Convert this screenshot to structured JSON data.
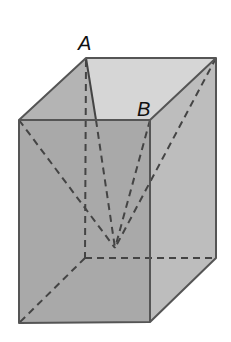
{
  "diagram": {
    "type": "rectangular-prism",
    "labels": {
      "A": "A",
      "B": "B"
    },
    "colors": {
      "background": "#ffffff",
      "front_face": "#a9a9a9",
      "right_face": "#bdbdbd",
      "top_face": "#d6d6d6",
      "left_top_face": "#b2b2b2",
      "edge": "#555555",
      "dashed": "#444444",
      "label": "#111111"
    },
    "vertices": {
      "A_back_top_left": [
        86,
        58
      ],
      "back_top_right": [
        216,
        58
      ],
      "front_top_left": [
        19,
        120
      ],
      "B_front_top_right": [
        150,
        120
      ],
      "front_bottom_left": [
        19,
        323
      ],
      "front_bottom_right": [
        150,
        322
      ],
      "back_bottom_right": [
        216,
        258
      ],
      "back_bottom_left_hidden": [
        85,
        258
      ],
      "apex_interior": [
        115,
        248
      ]
    }
  }
}
